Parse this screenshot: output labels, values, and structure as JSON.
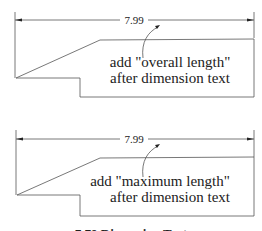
{
  "figures": [
    {
      "dimension_value": "7.99",
      "note_line1": "add \"overall length\"",
      "note_line2": "after dimension text"
    },
    {
      "dimension_value": "7.99",
      "note_line1": "add \"maximum length\"",
      "note_line2": "after dimension text"
    }
  ],
  "caption": "7.79 Dimension Text"
}
